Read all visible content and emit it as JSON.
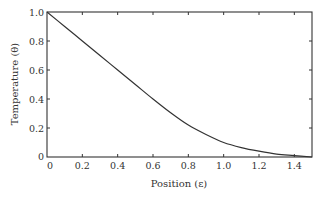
{
  "chart_data": {
    "type": "line",
    "title": "",
    "xlabel": "Position (ε)",
    "ylabel": "Temperature (θ)",
    "xlim": [
      0,
      1.5
    ],
    "ylim": [
      0,
      1.0
    ],
    "x_ticks": [
      0,
      0.2,
      0.4,
      0.6,
      0.8,
      1.0,
      1.2,
      1.4
    ],
    "x_tick_labels": [
      "0",
      "0.2",
      "0.4",
      "0.6",
      "0.8",
      "1.0",
      "1.2",
      "1.4"
    ],
    "y_ticks": [
      0,
      0.2,
      0.4,
      0.6,
      0.8,
      1.0
    ],
    "y_tick_labels": [
      "0",
      "0.2",
      "0.4",
      "0.6",
      "0.8",
      "1.0"
    ],
    "grid": false,
    "legend": null,
    "series": [
      {
        "name": "Temperature",
        "x": [
          0,
          0.1,
          0.2,
          0.3,
          0.4,
          0.5,
          0.6,
          0.7,
          0.8,
          0.9,
          1.0,
          1.1,
          1.2,
          1.3,
          1.4,
          1.5
        ],
        "y": [
          1.0,
          0.9,
          0.8,
          0.7,
          0.6,
          0.5,
          0.4,
          0.305,
          0.22,
          0.155,
          0.1,
          0.065,
          0.04,
          0.02,
          0.01,
          0.0
        ],
        "color": "#333333"
      }
    ]
  },
  "colors": {
    "axis": "#333333",
    "line": "#333333",
    "background": "#ffffff"
  }
}
